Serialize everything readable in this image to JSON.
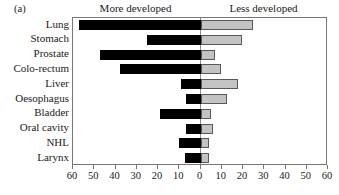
{
  "figure": {
    "panel_label": "(a)"
  },
  "headers": {
    "left": "More developed",
    "right": "Less developed"
  },
  "colors": {
    "more_developed_bar": "#000000",
    "less_developed_bar": "#c3c3c3",
    "less_developed_bar_border": "#595959",
    "axis": "#777777",
    "text": "#1a1a1a"
  },
  "chart_data": {
    "type": "bar",
    "orientation": "horizontal",
    "style": "diverging-bidirectional",
    "title": "(a)",
    "xlabel": "",
    "ylabel": "",
    "categories": [
      "Lung",
      "Stomach",
      "Prostate",
      "Colo-rectum",
      "Liver",
      "Oesophagus",
      "Bladder",
      "Oral cavity",
      "NHL",
      "Larynx"
    ],
    "series": [
      {
        "name": "More developed",
        "side": "left",
        "color": "#000000",
        "values": [
          57,
          25,
          47.5,
          38,
          9,
          7,
          19,
          7,
          10,
          7.5
        ]
      },
      {
        "name": "Less developed",
        "side": "right",
        "color": "#c3c3c3",
        "values": [
          24.5,
          19.5,
          7,
          9.5,
          17.5,
          12.5,
          5,
          6,
          4,
          4
        ]
      }
    ],
    "xlim_left": [
      0,
      60
    ],
    "xlim_right": [
      0,
      60
    ],
    "xticks": [
      60,
      50,
      40,
      30,
      20,
      10,
      0,
      10,
      20,
      30,
      40,
      50,
      60
    ],
    "xtick_labels": [
      "60",
      "50",
      "40",
      "30",
      "20",
      "10",
      "0",
      "10",
      "20",
      "30",
      "40",
      "50",
      "60"
    ],
    "grid": false,
    "legend": "column-headers-above-plot"
  }
}
